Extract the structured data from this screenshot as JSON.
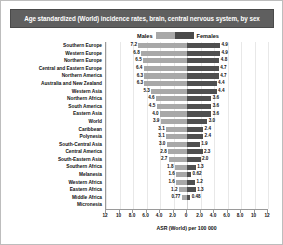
{
  "chart_data": {
    "type": "bar",
    "subtype": "diverging-population-pyramid",
    "title": "Age standardized (World) incidence rates, brain, central nervous system, by sex",
    "xlabel": "ASR (World) per 100 000",
    "ylabel": "",
    "legend": [
      {
        "name": "Males",
        "color": "#a8a8a8"
      },
      {
        "name": "Females",
        "color": "#4f4f4f"
      }
    ],
    "legend_position": "top-center",
    "grid": true,
    "axis_max": 12,
    "xticks": [
      "12",
      "10",
      "8.0",
      "6.0",
      "4.0",
      "2.0",
      "0",
      "2.0",
      "4.0",
      "6.0",
      "8.0",
      "10",
      "12"
    ],
    "xtick_values": [
      12,
      10,
      8,
      6,
      4,
      2,
      0,
      2,
      4,
      6,
      8,
      10,
      12
    ],
    "categories": [
      "Southern Europe",
      "Western Europe",
      "Northern Europe",
      "Central and Eastern Europe",
      "Northern America",
      "Australia and New Zealand",
      "Western Asia",
      "Northern Africa",
      "South America",
      "Eastern Asia",
      "World",
      "Caribbean",
      "Polynesia",
      "South-Central Asia",
      "Central America",
      "South-Eastern Asia",
      "Southern Africa",
      "Melanesia",
      "Western Africa",
      "Eastern Africa",
      "Middle Africa",
      "Micronesia"
    ],
    "series": [
      {
        "name": "Males",
        "color": "#a8a8a8",
        "values": [
          7.2,
          6.8,
          6.5,
          6.4,
          6.3,
          6.3,
          5.3,
          4.6,
          4.5,
          4.0,
          3.9,
          3.1,
          3.1,
          3.0,
          2.8,
          2.7,
          1.8,
          1.6,
          1.6,
          1.2,
          0.77,
          0.0
        ],
        "labels": [
          "7.2",
          "6.8",
          "6.5",
          "6.4",
          "6.3",
          "6.3",
          "5.3",
          "4.6",
          "4.5",
          "4.0",
          "3.9",
          "3.1",
          "3.1",
          "3.0",
          "2.8",
          "2.7",
          "1.8",
          "1.6",
          "1.6",
          "1.2",
          "0.77",
          ""
        ]
      },
      {
        "name": "Females",
        "color": "#4f4f4f",
        "values": [
          4.9,
          4.9,
          4.8,
          4.7,
          4.7,
          4.4,
          4.4,
          3.6,
          3.6,
          3.6,
          3.0,
          2.4,
          2.4,
          1.9,
          2.3,
          2.0,
          1.3,
          0.62,
          1.2,
          1.3,
          0.48,
          0.0
        ],
        "labels": [
          "4.9",
          "4.9",
          "4.8",
          "4.7",
          "4.7",
          "4.4",
          "4.4",
          "3.6",
          "3.6",
          "3.6",
          "3.0",
          "2.4",
          "2.4",
          "1.9",
          "2.3",
          "2.0",
          "1.3",
          "0.62",
          "1.2",
          "1.3",
          "0.48",
          ""
        ]
      }
    ]
  }
}
